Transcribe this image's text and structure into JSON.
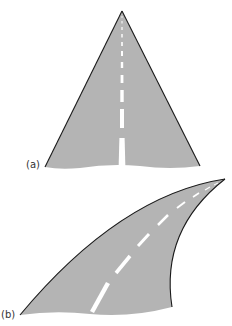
{
  "figure": {
    "panels": [
      {
        "id": "a",
        "label": "(a)",
        "description": "straight road receding in perspective"
      },
      {
        "id": "b",
        "label": "(b)",
        "description": "curving road receding in perspective"
      }
    ],
    "colors": {
      "road": "#b4b4b4",
      "edge": "#1a1a1a",
      "marking": "#ffffff",
      "background": "#ffffff"
    }
  }
}
